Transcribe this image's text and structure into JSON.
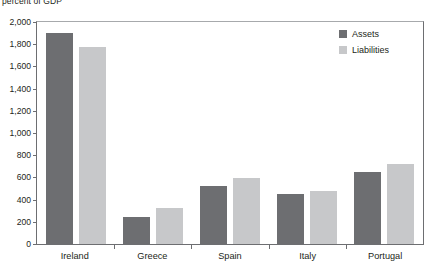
{
  "chart_data": {
    "type": "bar",
    "title": "",
    "subtitle": "",
    "axis_caption": "percent of GDP",
    "xlabel": "",
    "ylabel": "percent of GDP",
    "categories": [
      "Ireland",
      "Greece",
      "Spain",
      "Italy",
      "Portugal"
    ],
    "series": [
      {
        "name": "Assets",
        "color": "#6d6e71",
        "values": [
          1900,
          243,
          524,
          455,
          645
        ]
      },
      {
        "name": "Liabilities",
        "color": "#c7c8ca",
        "values": [
          1775,
          324,
          592,
          482,
          718
        ]
      }
    ],
    "ylim": [
      0,
      2000
    ],
    "yticks": [
      0,
      200,
      400,
      600,
      800,
      1000,
      1200,
      1400,
      1600,
      1800,
      2000
    ],
    "ytick_labels": [
      "0",
      "200",
      "400",
      "600",
      "800",
      "1,000",
      "1,200",
      "1,400",
      "1,600",
      "1,800",
      "2,000"
    ],
    "grid": false,
    "legend_position": "top-right"
  },
  "legend": {
    "items": [
      {
        "label": "Assets",
        "color": "#6d6e71"
      },
      {
        "label": "Liabilities",
        "color": "#c7c8ca"
      }
    ]
  },
  "colors": {
    "assets": "#6d6e71",
    "liabilities": "#c7c8ca",
    "axis": "#6d6e71",
    "text": "#231f20",
    "background": "#ffffff"
  }
}
